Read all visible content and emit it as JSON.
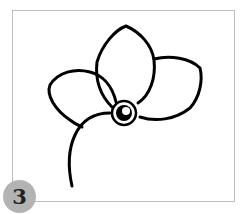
{
  "step": {
    "number": "3"
  },
  "drawing": {
    "subject": "flower-outline",
    "petals": 3,
    "stroke_color": "#000000",
    "frame_color": "#bdbdbd",
    "badge_color": "#b3b3b3"
  }
}
